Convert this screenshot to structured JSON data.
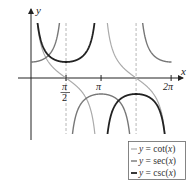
{
  "chart_data": {
    "type": "line",
    "title": "",
    "xlabel": "x",
    "ylabel": "y",
    "xlim": [
      -0.6,
      6.75
    ],
    "ylim": [
      -3.5,
      3.5
    ],
    "x_ticks": [
      {
        "value": 1.5708,
        "label_num": "π",
        "label_den": "2"
      },
      {
        "value": 3.1416,
        "label": "π"
      },
      {
        "value": 6.2832,
        "label": "2π"
      }
    ],
    "asymptotes": [
      1.5708,
      4.7124
    ],
    "grid": false,
    "legend_position": "bottom-right",
    "series": [
      {
        "name": "y = cot(x)",
        "func": "cot",
        "color": "#aaaaaa",
        "width": 1.2
      },
      {
        "name": "y = sec(x)",
        "func": "sec",
        "color": "#777777",
        "width": 1.4
      },
      {
        "name": "y = csc(x)",
        "func": "csc",
        "color": "#222222",
        "width": 1.8
      }
    ]
  },
  "labels": {
    "x_axis": "x",
    "y_axis": "y",
    "pi": "π",
    "two": "2",
    "two_pi": "2π"
  },
  "legend": [
    {
      "prefix": "y",
      "text": " = cot(",
      "var": "x",
      "suffix": ")"
    },
    {
      "prefix": "y",
      "text": " = sec(",
      "var": "x",
      "suffix": ")"
    },
    {
      "prefix": "y",
      "text": " = csc(",
      "var": "x",
      "suffix": ")"
    }
  ]
}
